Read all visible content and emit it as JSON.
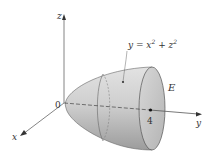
{
  "figure": {
    "axes": {
      "z_label": "z",
      "y_label": "y",
      "x_label": "x",
      "origin_label": "0"
    },
    "surface": {
      "equation_lhs": "y = x",
      "equation_exp1": "2",
      "equation_mid": " + z",
      "equation_exp2": "2",
      "region_label": "E",
      "tick_value": "4"
    },
    "colors": {
      "surface_fill": "#c8c8c8",
      "surface_dark": "#9a9a9a",
      "cap_fill": "#d4d4d4",
      "axis": "#555555"
    }
  }
}
